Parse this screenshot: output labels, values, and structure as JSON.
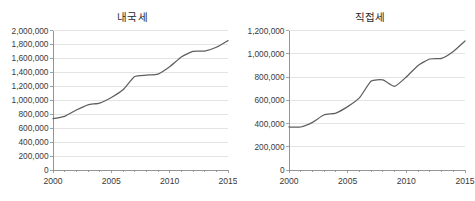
{
  "figure": {
    "background_color": "#ffffff",
    "line_color": "#5f5f5f",
    "grid_color": "#d9d9d9",
    "axis_color": "#8a8a8a"
  },
  "panels": [
    {
      "name": "domestic-tax",
      "title": "내국세"
    },
    {
      "name": "direct-tax",
      "title": "직접세"
    }
  ],
  "chart_data": [
    {
      "type": "line",
      "title": "내국세",
      "xlabel": "",
      "ylabel": "",
      "grid": true,
      "legend": "none",
      "xlim": [
        2000,
        2015
      ],
      "ylim": [
        0,
        2000000
      ],
      "xticks": [
        2000,
        2005,
        2010,
        2015
      ],
      "xtick_labels": [
        "2000",
        "2005",
        "2010",
        "2015"
      ],
      "xminor_ticks": [
        2000,
        2001,
        2002,
        2003,
        2004,
        2005,
        2006,
        2007,
        2008,
        2009,
        2010,
        2011,
        2012,
        2013,
        2014,
        2015
      ],
      "yticks": [
        0,
        200000,
        400000,
        600000,
        800000,
        1000000,
        1200000,
        1400000,
        1600000,
        1800000,
        2000000
      ],
      "ytick_labels": [
        "0",
        "200,000",
        "400,000",
        "600,000",
        "800,000",
        "1,000,000",
        "1,200,000",
        "1,400,000",
        "1,600,000",
        "1,800,000",
        "2,000,000"
      ],
      "x": [
        2000,
        2001,
        2002,
        2003,
        2004,
        2005,
        2006,
        2007,
        2008,
        2009,
        2010,
        2011,
        2012,
        2013,
        2014,
        2015
      ],
      "values": [
        735000,
        770000,
        860000,
        935000,
        960000,
        1040000,
        1150000,
        1340000,
        1360000,
        1375000,
        1480000,
        1620000,
        1700000,
        1705000,
        1760000,
        1855000
      ],
      "series": [
        {
          "name": "내국세",
          "values": [
            735000,
            770000,
            860000,
            935000,
            960000,
            1040000,
            1150000,
            1340000,
            1360000,
            1375000,
            1480000,
            1620000,
            1700000,
            1705000,
            1760000,
            1855000
          ]
        }
      ]
    },
    {
      "type": "line",
      "title": "직접세",
      "xlabel": "",
      "ylabel": "",
      "grid": true,
      "legend": "none",
      "xlim": [
        2000,
        2015
      ],
      "ylim": [
        0,
        1200000
      ],
      "xticks": [
        2000,
        2005,
        2010,
        2015
      ],
      "xtick_labels": [
        "2000",
        "2005",
        "2010",
        "2015"
      ],
      "xminor_ticks": [
        2000,
        2001,
        2002,
        2003,
        2004,
        2005,
        2006,
        2007,
        2008,
        2009,
        2010,
        2011,
        2012,
        2013,
        2014,
        2015
      ],
      "yticks": [
        0,
        200000,
        400000,
        600000,
        800000,
        1000000,
        1200000
      ],
      "ytick_labels": [
        "0",
        "200,000",
        "400,000",
        "600,000",
        "800,000",
        "1,000,000",
        "1,200,000"
      ],
      "x": [
        2000,
        2001,
        2002,
        2003,
        2004,
        2005,
        2006,
        2007,
        2008,
        2009,
        2010,
        2011,
        2012,
        2013,
        2014,
        2015
      ],
      "values": [
        370000,
        370000,
        410000,
        475000,
        490000,
        545000,
        620000,
        765000,
        775000,
        720000,
        800000,
        900000,
        955000,
        960000,
        1020000,
        1110000
      ],
      "series": [
        {
          "name": "직접세",
          "values": [
            370000,
            370000,
            410000,
            475000,
            490000,
            545000,
            620000,
            765000,
            775000,
            720000,
            800000,
            900000,
            955000,
            960000,
            1020000,
            1110000
          ]
        }
      ]
    }
  ]
}
